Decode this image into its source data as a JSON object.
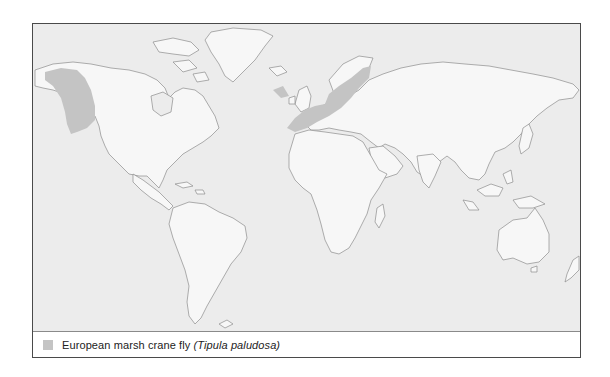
{
  "map": {
    "title": "Distribution map",
    "colors": {
      "ocean": "#ececec",
      "land": "#f7f7f7",
      "coastline": "#8c8c8c",
      "range": "#c4c4c4",
      "frame": "#4a4a4a"
    },
    "ranges": [
      {
        "name": "Western North America"
      },
      {
        "name": "Northern Europe"
      }
    ]
  },
  "legend": {
    "items": [
      {
        "swatch_color": "#c4c4c4",
        "common_name": "European marsh crane fly",
        "scientific_name": "(Tipula paludosa)"
      }
    ]
  }
}
